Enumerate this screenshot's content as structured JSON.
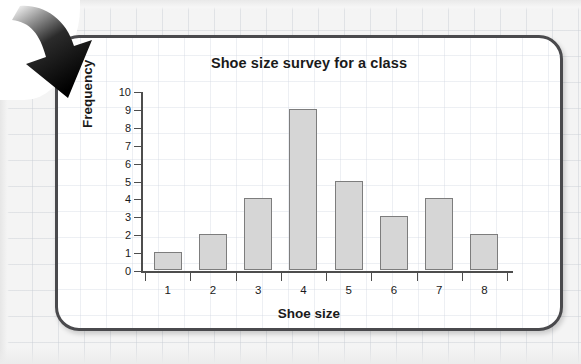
{
  "chart_data": {
    "type": "bar",
    "title": "Shoe size survey for a class",
    "xlabel": "Shoe size",
    "ylabel": "Frequency",
    "categories": [
      "1",
      "2",
      "3",
      "4",
      "5",
      "6",
      "7",
      "8"
    ],
    "values": [
      1,
      2,
      4,
      9,
      5,
      3,
      4,
      2
    ],
    "ylim": [
      0,
      10
    ],
    "ytick_labels": [
      "0",
      "1",
      "2",
      "3",
      "4",
      "5",
      "6",
      "7",
      "8",
      "9",
      "10"
    ],
    "grid": true,
    "legend": "none",
    "bar_fill": "#d6d6d6",
    "bar_stroke": "#7d7d7d",
    "axis_color": "#4d4d4d"
  },
  "card": {
    "border_color": "#4a4a4d",
    "background": "#ffffff"
  },
  "decoration": {
    "arrow_icon": "curved-down-right-arrow",
    "arrow_color": "#111111"
  }
}
